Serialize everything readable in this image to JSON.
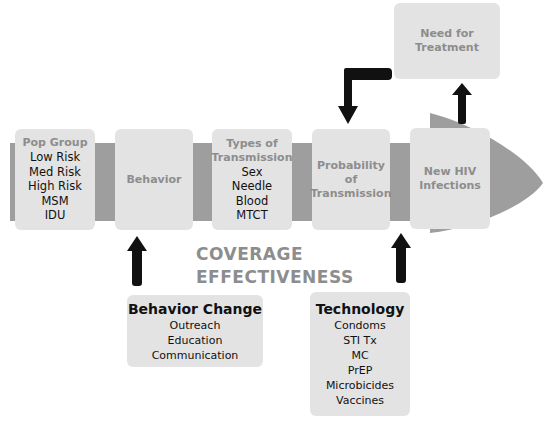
{
  "flow": {
    "stages": [
      {
        "title": "Pop Group",
        "items": [
          "Low Risk",
          "Med Risk",
          "High Risk",
          "MSM",
          "IDU"
        ]
      },
      {
        "title": "Behavior",
        "items": []
      },
      {
        "title_lines": [
          "Types of",
          "Transmission"
        ],
        "items": [
          "Sex",
          "Needle",
          "Blood",
          "MTCT"
        ]
      },
      {
        "title_lines": [
          "Probability",
          "of",
          "Transmission"
        ],
        "items": []
      },
      {
        "title_lines": [
          "New HIV",
          "Infections"
        ],
        "items": []
      }
    ]
  },
  "outcome": {
    "title_lines": [
      "Need for",
      "Treatment"
    ]
  },
  "center_label": {
    "lines": [
      "COVERAGE",
      "EFFECTIVENESS"
    ]
  },
  "interventions": [
    {
      "title": "Behavior Change",
      "items": [
        "Outreach",
        "Education",
        "Communication"
      ]
    },
    {
      "title": "Technology",
      "items": [
        "Condoms",
        "STI Tx",
        "MC",
        "PrEP",
        "Microbicides",
        "Vaccines"
      ]
    }
  ],
  "colors": {
    "box": "#e3e3e3",
    "band": "#9e9e9e",
    "title": "#8d8d8d",
    "arrow": "#111111"
  }
}
